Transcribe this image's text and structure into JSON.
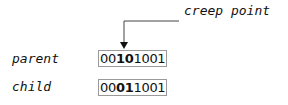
{
  "annotation": "creep point",
  "rows": [
    {
      "label": "parent",
      "prefix": "00",
      "highlight": "10",
      "suffix": "1001"
    },
    {
      "label": "child",
      "prefix": "00",
      "highlight": "01",
      "suffix": "1001"
    }
  ]
}
